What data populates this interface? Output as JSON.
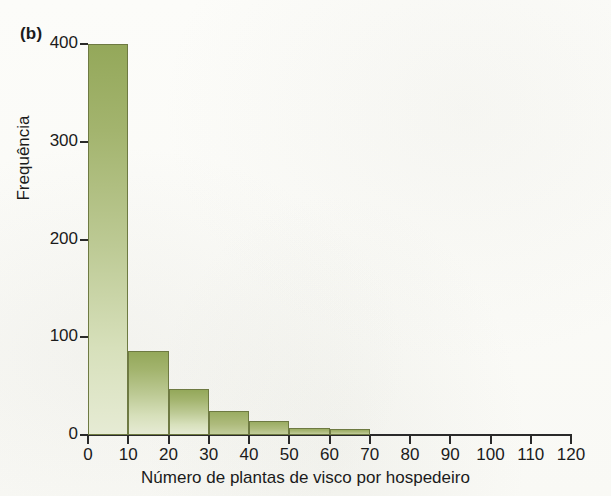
{
  "figure": {
    "panel_label": "(b)"
  },
  "chart_data": {
    "type": "bar",
    "title": "",
    "subtitle": "",
    "xlabel": "Número de plantas de visco por hospedeiro",
    "ylabel": "Frequência",
    "categories": [
      "0-10",
      "10-20",
      "20-30",
      "30-40",
      "40-50",
      "50-60",
      "60-70"
    ],
    "bin_starts": [
      0,
      10,
      20,
      30,
      40,
      50,
      60
    ],
    "bin_width": 10,
    "values": [
      400,
      86,
      47,
      25,
      14,
      7,
      6
    ],
    "xlim": [
      0,
      120
    ],
    "ylim": [
      0,
      400
    ],
    "xticks": [
      0,
      10,
      20,
      30,
      40,
      50,
      60,
      70,
      80,
      90,
      100,
      110,
      120
    ],
    "yticks": [
      0,
      100,
      200,
      300,
      400
    ],
    "xtick_labels": [
      "0",
      "10",
      "20",
      "30",
      "40",
      "50",
      "60",
      "70",
      "80",
      "90",
      "100",
      "110",
      "120"
    ],
    "ytick_labels": [
      "0",
      "100",
      "200",
      "300",
      "400"
    ],
    "grid": false,
    "legend": null,
    "legend_position": "none",
    "annotations": [
      "(b)"
    ],
    "colors": {
      "bar_fill_top": "#94a85a",
      "bar_fill_bottom": "#e6ebd4",
      "bar_edge": "#6e7a42",
      "axis": "#2a2a2a",
      "text": "#1b1b1b",
      "background": "#fbfbf8"
    }
  }
}
